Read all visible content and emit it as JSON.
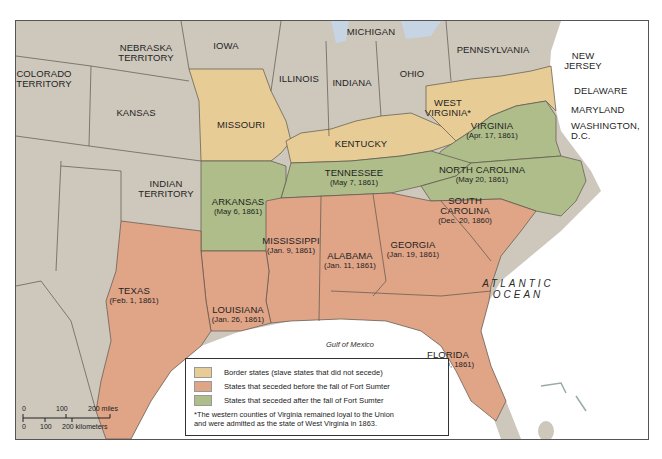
{
  "map": {
    "colors": {
      "border_state": "#e8cc95",
      "seceded_before": "#e0a487",
      "seceded_after": "#aebd8a",
      "other": "#cdc7bc",
      "water": "#ffffff",
      "water_edge": "#c7d4e3",
      "state_line": "#5a544c"
    },
    "labels": {
      "nebraska": "NEBRASKA",
      "nebraska2": "TERRITORY",
      "iowa": "IOWA",
      "michigan": "MICHIGAN",
      "pennsylvania": "PENNSYLVANIA",
      "new_jersey": "NEW",
      "new_jersey2": "JERSEY",
      "colorado": "COLORADO",
      "colorado2": "TERRITORY",
      "illinois": "ILLINOIS",
      "indiana": "INDIANA",
      "ohio": "OHIO",
      "kansas": "KANSAS",
      "missouri": "MISSOURI",
      "kentucky": "KENTUCKY",
      "west_virginia": "WEST",
      "west_virginia2": "VIRGINIA*",
      "delaware": "DELAWARE",
      "maryland": "MARYLAND",
      "washington": "WASHINGTON,",
      "washington2": "D.C.",
      "indian_territory": "INDIAN",
      "indian_territory2": "TERRITORY"
    },
    "seceded_states": [
      {
        "name": "VIRGINIA",
        "date": "(Apr. 17, 1861)"
      },
      {
        "name": "NORTH CAROLINA",
        "date": "(May 20, 1861)"
      },
      {
        "name": "TENNESSEE",
        "date": "(May 7, 1861)"
      },
      {
        "name": "ARKANSAS",
        "date": "(May 6, 1861)"
      },
      {
        "name": "SOUTH",
        "name2": "CAROLINA",
        "date": "(Dec. 20, 1860)"
      },
      {
        "name": "MISSISSIPPI",
        "date": "(Jan. 9, 1861)"
      },
      {
        "name": "ALABAMA",
        "date": "(Jan. 11, 1861)"
      },
      {
        "name": "GEORGIA",
        "date": "(Jan. 19, 1861)"
      },
      {
        "name": "TEXAS",
        "date": "(Feb. 1, 1861)"
      },
      {
        "name": "LOUISIANA",
        "date": "(Jan. 26, 1861)"
      },
      {
        "name": "FLORIDA",
        "date": "(Jan. 10, 1861)"
      }
    ],
    "water_labels": {
      "atlantic1": "ATLANTIC",
      "atlantic2": "OCEAN",
      "gulf": "Gulf of Mexico"
    }
  },
  "legend": {
    "items": [
      {
        "label": "Border states (slave states that did not secede)",
        "color": "#e8cc95"
      },
      {
        "label": "States that seceded before the fall of Fort Sumter",
        "color": "#e0a487"
      },
      {
        "label": "States that seceded after the fall of Fort Sumter",
        "color": "#aebd8a"
      }
    ],
    "note_line1": "*The western counties of Virginia remained loyal to the Union",
    "note_line2": "and were admitted as the state of West Virginia in 1863."
  },
  "scale_bar": {
    "miles": [
      "0",
      "100",
      "200 miles"
    ],
    "km": [
      "0",
      "100",
      "200 kilometers"
    ]
  }
}
